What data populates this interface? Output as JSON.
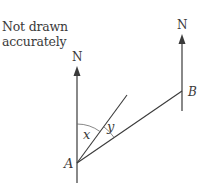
{
  "note": "Not drawn\naccurately",
  "labels": {
    "north_left": "N",
    "north_right": "N",
    "point_a": "A",
    "point_b": "B",
    "angle_x": "x",
    "angle_y": "y"
  },
  "colors": {
    "line": "#3a3a3a",
    "arc": "#6a6a6a",
    "text": "#3a3a3a"
  }
}
